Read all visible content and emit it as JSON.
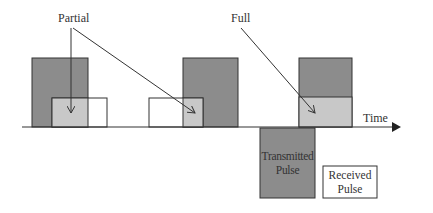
{
  "labels": {
    "partial": "Partial",
    "full": "Full",
    "time": "Time"
  },
  "legend": {
    "transmitted": "Transmitted Pulse",
    "transmitted_line1": "Transmitted",
    "transmitted_line2": "Pulse",
    "received_line1": "Received",
    "received_line2": "Pulse"
  },
  "colors": {
    "transmitted": "#8c8c8c",
    "overlap": "#c8c8c8",
    "received": "#ffffff",
    "stroke": "#333333"
  }
}
